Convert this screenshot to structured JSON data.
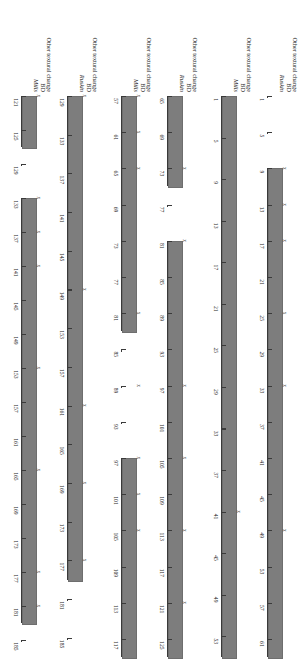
{
  "figure": {
    "orientation": "rotated-90",
    "bar_color": "#7d7d7d",
    "axis_color": "#3a3a3a",
    "marker_glyph": "x",
    "tick_step": 4,
    "groups": [
      {
        "name": "group-1",
        "rows": [
          {
            "name": "row-ruskin-1",
            "label_other": "Other textural change",
            "label_bd": "BD",
            "label_text": "Ruskin",
            "axis_min": 1,
            "axis_max": 63,
            "ticks": [
              1,
              5,
              9,
              13,
              17,
              21,
              25,
              29,
              33,
              37,
              41,
              45,
              49,
              53,
              57,
              61
            ],
            "tick_labels": [
              "1",
              "5",
              "9",
              "13",
              "17",
              "21",
              "25",
              "29",
              "33",
              "37",
              "41",
              "45",
              "49",
              "53",
              "57",
              "61"
            ],
            "segments": [
              [
                1,
                1
              ],
              [
                5,
                5
              ],
              [
                9,
                63
              ]
            ],
            "bars": [
              [
                9,
                63
              ]
            ],
            "markers": [
              9,
              13,
              17,
              25,
              33,
              49
            ]
          },
          {
            "name": "row-mills-1",
            "label_other": "Other textural change",
            "label_bd": "BD",
            "label_text": "Mills",
            "axis_min": 1,
            "axis_max": 55,
            "ticks": [
              1,
              5,
              9,
              13,
              17,
              21,
              25,
              29,
              33,
              37,
              41,
              45,
              49,
              53
            ],
            "tick_labels": [
              "1",
              "5",
              "9",
              "13",
              "17",
              "21",
              "25",
              "29",
              "33",
              "37",
              "41",
              "45",
              "49",
              "53"
            ],
            "segments": [
              [
                1,
                55
              ]
            ],
            "bars": [
              [
                1,
                55
              ]
            ],
            "markers": [
              41
            ]
          }
        ]
      },
      {
        "name": "group-2",
        "rows": [
          {
            "name": "row-ruskin-2",
            "label_other": "Other textural change",
            "label_bd": "BD",
            "label_text": "Ruskin",
            "axis_min": 65,
            "axis_max": 127,
            "ticks": [
              65,
              69,
              73,
              77,
              81,
              85,
              89,
              93,
              97,
              101,
              105,
              109,
              113,
              117,
              121,
              125
            ],
            "tick_labels": [
              "65",
              "69",
              "73",
              "77",
              "81",
              "85",
              "89",
              "93",
              "97",
              "101",
              "105",
              "109",
              "113",
              "117",
              "121",
              "125"
            ],
            "segments": [
              [
                65,
                75
              ],
              [
                77,
                77
              ],
              [
                81,
                127
              ]
            ],
            "bars": [
              [
                65,
                75
              ],
              [
                81,
                127
              ]
            ],
            "markers": [
              73,
              81,
              97,
              105,
              113,
              121
            ]
          },
          {
            "name": "row-mills-2",
            "label_other": "Other textural change",
            "label_bd": "BD",
            "label_text": "Mills",
            "axis_min": 57,
            "axis_max": 119,
            "ticks": [
              57,
              61,
              65,
              69,
              73,
              77,
              81,
              85,
              89,
              93,
              97,
              101,
              105,
              109,
              113,
              117
            ],
            "tick_labels": [
              "57",
              "61",
              "65",
              "69",
              "73",
              "77",
              "81",
              "85",
              "89",
              "93",
              "97",
              "101",
              "105",
              "109",
              "113",
              "117"
            ],
            "segments": [
              [
                57,
                83
              ],
              [
                85,
                85
              ],
              [
                89,
                89
              ],
              [
                93,
                93
              ],
              [
                97,
                119
              ]
            ],
            "bars": [
              [
                57,
                83
              ],
              [
                97,
                119
              ]
            ],
            "markers": [
              57,
              61,
              65,
              81,
              89,
              97,
              101,
              105
            ]
          }
        ]
      },
      {
        "name": "group-3",
        "rows": [
          {
            "name": "row-ruskin-3",
            "label_other": "Other textural change",
            "label_bd": "BD",
            "label_text": "Ruskin",
            "axis_min": 129,
            "axis_max": 187,
            "ticks": [
              129,
              133,
              137,
              141,
              145,
              149,
              153,
              157,
              161,
              165,
              169,
              173,
              177,
              181,
              185
            ],
            "tick_labels": [
              "129",
              "133",
              "137",
              "141",
              "145",
              "149",
              "153",
              "157",
              "161",
              "165",
              "169",
              "173",
              "177",
              "181",
              "185"
            ],
            "segments": [
              [
                129,
                179
              ],
              [
                181,
                181
              ],
              [
                185,
                185
              ]
            ],
            "bars": [
              [
                129,
                179
              ]
            ],
            "markers": [
              129,
              149,
              161,
              169,
              177
            ]
          },
          {
            "name": "row-mills-3",
            "label_other": "Other textural change",
            "label_bd": "BD",
            "label_text": "Mills",
            "axis_min": 121,
            "axis_max": 187,
            "ticks": [
              121,
              125,
              129,
              133,
              137,
              141,
              145,
              149,
              153,
              157,
              161,
              165,
              169,
              173,
              177,
              181,
              185
            ],
            "tick_labels": [
              "121",
              "125",
              "129",
              "133",
              "137",
              "141",
              "145",
              "149",
              "153",
              "157",
              "161",
              "165",
              "169",
              "173",
              "177",
              "181",
              "185"
            ],
            "segments": [
              [
                121,
                127
              ],
              [
                129,
                129
              ],
              [
                133,
                183
              ],
              [
                185,
                185
              ]
            ],
            "bars": [
              [
                121,
                127
              ],
              [
                133,
                183
              ]
            ],
            "markers": [
              121,
              133,
              137,
              141,
              153,
              165,
              177,
              181
            ]
          }
        ]
      }
    ]
  },
  "chart_data": {
    "type": "bar",
    "title": "",
    "xlabel": "",
    "ylabel": "",
    "grid": false,
    "legend": "none",
    "orientation": "horizontal-ranges",
    "tick_step": 4,
    "series": [
      {
        "name": "Ruskin",
        "group": 1,
        "axis_range": [
          1,
          63
        ],
        "tick_labels": [
          "1",
          "5",
          "9",
          "13",
          "17",
          "21",
          "25",
          "29",
          "33",
          "37",
          "41",
          "45",
          "49",
          "53",
          "57",
          "61"
        ],
        "bar_ranges": [
          [
            9,
            63
          ]
        ],
        "marker_positions": [
          9,
          13,
          17,
          25,
          33,
          49
        ]
      },
      {
        "name": "Mills",
        "group": 1,
        "axis_range": [
          1,
          55
        ],
        "tick_labels": [
          "1",
          "5",
          "9",
          "13",
          "17",
          "21",
          "25",
          "29",
          "33",
          "37",
          "41",
          "45",
          "49",
          "53"
        ],
        "bar_ranges": [
          [
            1,
            55
          ]
        ],
        "marker_positions": [
          41
        ]
      },
      {
        "name": "Ruskin",
        "group": 2,
        "axis_range": [
          65,
          127
        ],
        "tick_labels": [
          "65",
          "69",
          "73",
          "77",
          "81",
          "85",
          "89",
          "93",
          "97",
          "101",
          "105",
          "109",
          "113",
          "117",
          "121",
          "125"
        ],
        "bar_ranges": [
          [
            65,
            75
          ],
          [
            81,
            127
          ]
        ],
        "marker_positions": [
          73,
          81,
          97,
          105,
          113,
          121
        ]
      },
      {
        "name": "Mills",
        "group": 2,
        "axis_range": [
          57,
          119
        ],
        "tick_labels": [
          "57",
          "61",
          "65",
          "69",
          "73",
          "77",
          "81",
          "85",
          "89",
          "93",
          "97",
          "101",
          "105",
          "109",
          "113",
          "117"
        ],
        "bar_ranges": [
          [
            57,
            83
          ],
          [
            97,
            119
          ]
        ],
        "marker_positions": [
          57,
          61,
          65,
          81,
          89,
          97,
          101,
          105
        ]
      },
      {
        "name": "Ruskin",
        "group": 3,
        "axis_range": [
          129,
          187
        ],
        "tick_labels": [
          "129",
          "133",
          "137",
          "141",
          "145",
          "149",
          "153",
          "157",
          "161",
          "165",
          "169",
          "173",
          "177",
          "181",
          "185"
        ],
        "bar_ranges": [
          [
            129,
            179
          ]
        ],
        "marker_positions": [
          129,
          149,
          161,
          169,
          177
        ]
      },
      {
        "name": "Mills",
        "group": 3,
        "axis_range": [
          121,
          187
        ],
        "tick_labels": [
          "121",
          "125",
          "129",
          "133",
          "137",
          "141",
          "145",
          "149",
          "153",
          "157",
          "161",
          "165",
          "169",
          "173",
          "177",
          "181",
          "185"
        ],
        "bar_ranges": [
          [
            121,
            127
          ],
          [
            133,
            183
          ]
        ],
        "marker_positions": [
          121,
          133,
          137,
          141,
          153,
          165,
          177,
          181
        ]
      }
    ],
    "row_annotations": [
      "Other textural change",
      "BD"
    ]
  }
}
